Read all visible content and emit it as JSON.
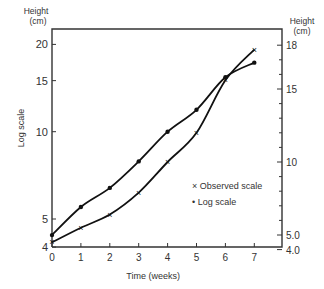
{
  "chart_data": {
    "type": "line",
    "title": "",
    "xlabel": "Time (weeks)",
    "ylabel_left": "Log scale",
    "ylabel_left_top": "Height",
    "ylabel_left_unit": "(cm)",
    "ylabel_right_top": "Height",
    "ylabel_right_unit": "(cm)",
    "x": [
      0,
      1,
      2,
      3,
      4,
      5,
      6,
      7
    ],
    "x_ticks": [
      "0",
      "1",
      "2",
      "3",
      "4",
      "5",
      "6",
      "7"
    ],
    "y_left_ticks": [
      "20",
      "15",
      "10",
      "5",
      "4"
    ],
    "y_left_scale": "log",
    "y_right_ticks": [
      "18",
      "15",
      "10",
      "5.0",
      "4.0"
    ],
    "y_right_scale": "linear",
    "ylim_left": [
      4,
      22
    ],
    "ylim_right": [
      4,
      19
    ],
    "grid": false,
    "legend_position": "inside right",
    "series": [
      {
        "name": "Observed scale",
        "marker": "x",
        "axis": "right",
        "values": [
          4.5,
          5.5,
          6.4,
          7.9,
          10.0,
          12.0,
          15.6,
          17.7
        ]
      },
      {
        "name": "Log scale",
        "marker": "dot",
        "axis": "left",
        "values": [
          4.4,
          5.5,
          6.4,
          7.9,
          10.0,
          11.9,
          15.4,
          17.3
        ]
      }
    ],
    "legend": [
      {
        "symbol": "×",
        "label": "Observed scale"
      },
      {
        "symbol": "•",
        "label": "Log scale"
      }
    ]
  }
}
